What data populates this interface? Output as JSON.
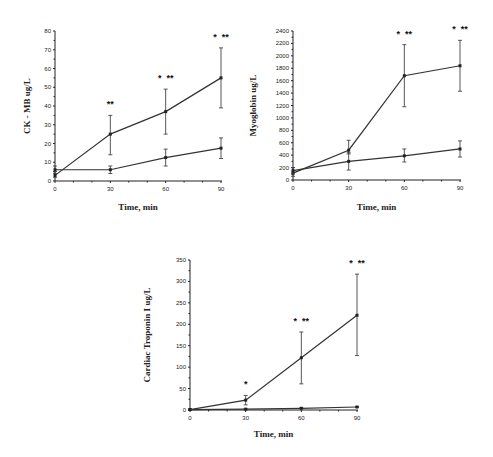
{
  "chart_data": [
    {
      "type": "line",
      "title": "",
      "xlabel": "Time, min",
      "ylabel": "CK - MB   ug/L",
      "x": [
        0,
        30,
        60,
        90
      ],
      "xticks": [
        "0",
        "30",
        "60",
        "90"
      ],
      "xlim": [
        0,
        90
      ],
      "ylim": [
        0,
        80
      ],
      "yticks": [
        "0",
        "10",
        "20",
        "30",
        "40",
        "50",
        "60",
        "70",
        "80"
      ],
      "grid": false,
      "series": [
        {
          "name": "group-a",
          "values": [
            3,
            25,
            37,
            55
          ],
          "err_upper": [
            5,
            35,
            49,
            71
          ],
          "err_lower": [
            2,
            14,
            25,
            39
          ]
        },
        {
          "name": "group-b",
          "values": [
            6,
            6,
            12.5,
            17.5
          ],
          "err_upper": [
            8,
            8,
            17,
            23
          ],
          "err_lower": [
            4,
            4,
            8,
            12
          ]
        }
      ],
      "annotations": [
        {
          "x": 30,
          "text": "**"
        },
        {
          "x": 60,
          "text": "*  **"
        },
        {
          "x": 90,
          "text": "*  **"
        }
      ]
    },
    {
      "type": "line",
      "title": "",
      "xlabel": "Time, min",
      "ylabel": "Myoglobin   ug/L",
      "x": [
        0,
        30,
        60,
        90
      ],
      "xticks": [
        "0",
        "30",
        "60",
        "90"
      ],
      "xlim": [
        0,
        90
      ],
      "ylim": [
        0,
        2400
      ],
      "yticks": [
        "0",
        "200",
        "400",
        "600",
        "800",
        "1000",
        "1200",
        "1400",
        "1600",
        "1800",
        "2000",
        "2200",
        "2400"
      ],
      "grid": false,
      "series": [
        {
          "name": "group-a",
          "values": [
            110,
            480,
            1680,
            1840
          ],
          "err_upper": [
            200,
            640,
            2180,
            2250
          ],
          "err_lower": [
            60,
            420,
            1180,
            1430
          ]
        },
        {
          "name": "group-b",
          "values": [
            150,
            300,
            390,
            500
          ],
          "err_upper": [
            200,
            440,
            500,
            630
          ],
          "err_lower": [
            100,
            160,
            290,
            370
          ]
        }
      ],
      "annotations": [
        {
          "x": 60,
          "text": "*  **"
        },
        {
          "x": 90,
          "text": "*  **"
        }
      ]
    },
    {
      "type": "line",
      "title": "",
      "xlabel": "Time, min",
      "ylabel": "Cardiac Troponin I   ug/L",
      "x": [
        0,
        30,
        60,
        90
      ],
      "xticks": [
        "0",
        "30",
        "60",
        "90"
      ],
      "xlim": [
        0,
        90
      ],
      "ylim": [
        0,
        350
      ],
      "yticks": [
        "0",
        "50",
        "100",
        "150",
        "200",
        "250",
        "300",
        "350"
      ],
      "grid": false,
      "series": [
        {
          "name": "group-a",
          "values": [
            1,
            23,
            122,
            221
          ],
          "err_upper": [
            2,
            34,
            182,
            317
          ],
          "err_lower": [
            0,
            12,
            61,
            127
          ]
        },
        {
          "name": "group-b",
          "values": [
            1,
            2,
            4,
            7
          ],
          "err_upper": [
            2,
            3,
            5,
            8
          ],
          "err_lower": [
            0,
            1,
            3,
            6
          ]
        }
      ],
      "annotations": [
        {
          "x": 30,
          "text": "*"
        },
        {
          "x": 60,
          "text": "*  **"
        },
        {
          "x": 90,
          "text": "*  **"
        }
      ]
    }
  ]
}
